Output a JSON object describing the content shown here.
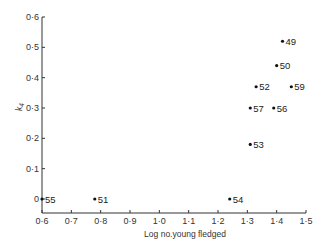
{
  "chart_data": {
    "type": "scatter",
    "title": "",
    "xlabel": "Log no.young fledged",
    "ylabel": "k4",
    "xlim": [
      0.6,
      1.5
    ],
    "ylim": [
      0,
      0.6
    ],
    "grid": false,
    "x_ticks": [
      "0·6",
      "0·7",
      "0·8",
      "0·9",
      "1·0",
      "1·1",
      "1·2",
      "1·3",
      "1·4",
      "1·5"
    ],
    "y_ticks": [
      "0",
      "0·1",
      "0·2",
      "0·3",
      "0·4",
      "0·5",
      "0·6"
    ],
    "points": [
      {
        "label": "49",
        "x": 1.42,
        "y": 0.52
      },
      {
        "label": "50",
        "x": 1.4,
        "y": 0.44
      },
      {
        "label": "52",
        "x": 1.33,
        "y": 0.37
      },
      {
        "label": "59",
        "x": 1.45,
        "y": 0.37
      },
      {
        "label": "57",
        "x": 1.31,
        "y": 0.3
      },
      {
        "label": "56",
        "x": 1.39,
        "y": 0.3
      },
      {
        "label": "53",
        "x": 1.31,
        "y": 0.18
      },
      {
        "label": "54",
        "x": 1.24,
        "y": 0.0
      },
      {
        "label": "51",
        "x": 0.78,
        "y": 0.0
      },
      {
        "label": "55",
        "x": 0.6,
        "y": 0.0
      }
    ]
  }
}
